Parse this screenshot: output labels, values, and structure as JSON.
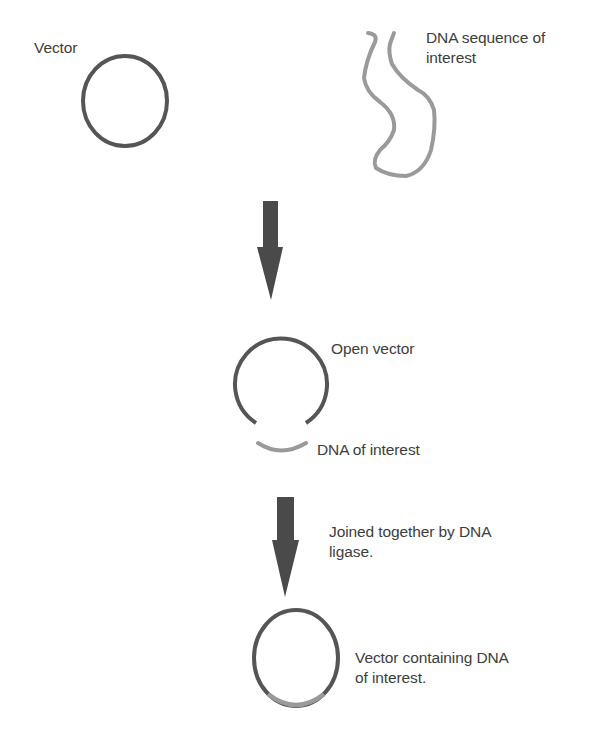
{
  "diagram": {
    "colors": {
      "vector": "#555555",
      "dna": "#9a9a9a",
      "arrow": "#4a4a4a",
      "text": "#3d3d3d",
      "background": "#ffffff"
    },
    "step1": {
      "vector_label": "Vector",
      "dna_label": "DNA sequence of\ninterest"
    },
    "arrow1": {
      "icon": "down-arrow-icon"
    },
    "step2": {
      "open_vector_label": "Open vector",
      "dna_fragment_label": "DNA of interest"
    },
    "arrow2": {
      "icon": "down-arrow-icon",
      "label": "Joined together by DNA\nligase."
    },
    "step3": {
      "result_label": "Vector containing DNA\nof interest."
    }
  }
}
